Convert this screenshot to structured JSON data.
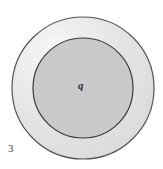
{
  "figure": {
    "number_label": "3",
    "charge_label": "q",
    "outer_shell": {
      "cx": 83,
      "cy": 88,
      "r": 71,
      "fill": "#e4e4e4",
      "highlight": "#f4f4f4",
      "stroke": "#555555"
    },
    "inner_sphere": {
      "cx": 83,
      "cy": 88,
      "r": 50,
      "fill": "#c9c9c9",
      "stroke": "#3a3a3a"
    }
  }
}
